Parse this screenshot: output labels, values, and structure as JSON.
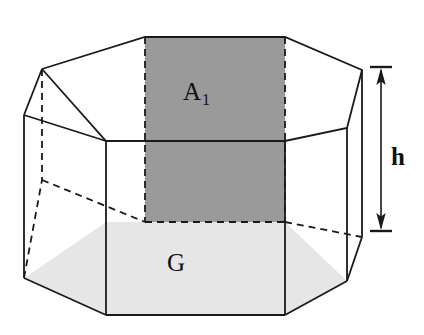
{
  "figure": {
    "background_color": "#ffffff",
    "width": 424,
    "height": 335
  },
  "labels": {
    "lateral_face": {
      "base": "A",
      "subscript": "1",
      "full": "A1",
      "meaning": "area of one lateral face"
    },
    "base_face": {
      "text": "G",
      "meaning": "area of the base"
    },
    "height": {
      "text": "h",
      "meaning": "height of the prism"
    }
  },
  "colors": {
    "lateral_face_fill": "#9a9a9a",
    "base_face_fill": "#e6e6e6",
    "stroke": "#1a1a1a",
    "body_fill": "#ffffff",
    "label_color": "#101010"
  },
  "geometry": {
    "top_face_vertices": [
      [
        42,
        69
      ],
      [
        145,
        37
      ],
      [
        285,
        37
      ],
      [
        362,
        70
      ],
      [
        347,
        128
      ],
      [
        285,
        141
      ],
      [
        145,
        141
      ],
      [
        106,
        141
      ]
    ],
    "bottom_face_vertices": [
      [
        24,
        278
      ],
      [
        106,
        315
      ],
      [
        285,
        315
      ],
      [
        347,
        281
      ],
      [
        362,
        237
      ],
      [
        285,
        222
      ],
      [
        145,
        222
      ],
      [
        106,
        222
      ]
    ],
    "lateral_face_rect": {
      "x1": 145,
      "y1": 37,
      "x2": 285,
      "y2": 222
    },
    "front_top_edge_y": 141,
    "front_bottom_edge_y": 315,
    "dimension_arrow": {
      "x": 381,
      "y_top": 70,
      "y_bottom": 228
    }
  },
  "stroke_widths": {
    "solid_edge": 1.8,
    "dashed_edge": 1.8,
    "dimension_line": 1.6
  },
  "dash_pattern": "7,5"
}
